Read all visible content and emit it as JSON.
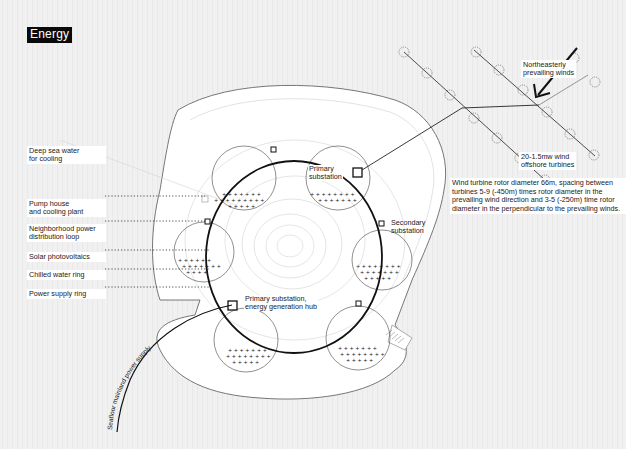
{
  "title": "Energy",
  "left_labels": [
    {
      "id": "deep-sea-water",
      "text": "Deep sea water\nfor cooling"
    },
    {
      "id": "pump-house",
      "text": "Pump house\nand cooling plant"
    },
    {
      "id": "neighborhood-power",
      "text": "Neighborhood power\ndistribution loop"
    },
    {
      "id": "solar-photovoltaics",
      "text": "Solar photovoltaics"
    },
    {
      "id": "chilled-water-ring",
      "text": "Chilled water ring"
    },
    {
      "id": "power-supply-ring",
      "text": "Power supply ring"
    }
  ],
  "ring_labels": {
    "primary_substation": "Primary\nsubstation",
    "secondary_substation": "Secondary\nsubstation",
    "primary_hub": "Primary substation,\nenergy generation hub"
  },
  "wind": {
    "prevailing": "Northeasterly\nprevailing winds",
    "turbines": "20-1.5mw wind\noffshore turbines",
    "note": "Wind turbine rotor diameter 66m, spacing between turbines 5-9 (-450m) times rotor diameter in the prevailing wind direction and 3-5 (-250m) time rotor diameter in the perpendicular to the prevailing winds."
  },
  "power_supply_label": "Seafloor mainland power supply",
  "colors": {
    "line": "#111111",
    "faint": "#b8b8b8",
    "island": "#ffffff",
    "title_bg": "#0a0a0a"
  }
}
